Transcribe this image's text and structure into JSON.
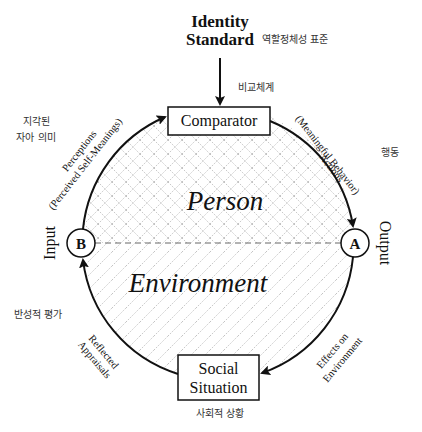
{
  "diagram": {
    "top_input": {
      "label_line1": "Identity",
      "label_line2": "Standard",
      "korean": "역할정체성 표준"
    },
    "comparator": {
      "label": "Comparator",
      "korean": "비교체계"
    },
    "social_situation": {
      "label_line1": "Social",
      "label_line2": "Situation",
      "korean": "사회적 상황"
    },
    "nodes": {
      "output_node": {
        "letter": "A",
        "side_label": "Output"
      },
      "input_node": {
        "letter": "B",
        "side_label": "Input"
      }
    },
    "regions": {
      "upper": "Person",
      "lower": "Environment"
    },
    "arcs": {
      "actions": {
        "line1": "Actions",
        "line2": "(Meaningful Behavior)",
        "korean": "행동"
      },
      "effects": {
        "line1": "Effects on",
        "line2": "Environment"
      },
      "reflected": {
        "line1": "Reflected",
        "line2": "Appraisals",
        "korean": "반성적 평가"
      },
      "perceptions": {
        "line1": "Perceptions",
        "line2": "(Perceived Self-Meanings)",
        "korean_line1": "지각된",
        "korean_line2": "자아 의미"
      }
    },
    "colors": {
      "stroke": "#111111",
      "hatch": "#9a9a9a",
      "divider": "#666666"
    }
  }
}
